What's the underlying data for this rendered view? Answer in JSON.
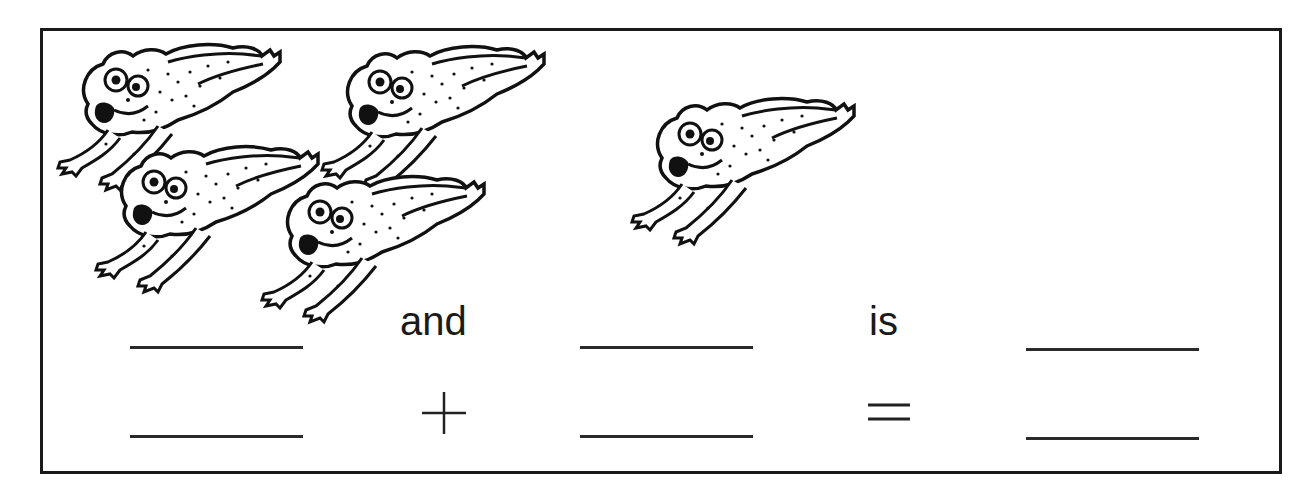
{
  "worksheet": {
    "title": "Frog addition worksheet",
    "group_a": {
      "count": 4,
      "icon": "frog-icon"
    },
    "group_b": {
      "count": 1,
      "icon": "frog-icon"
    },
    "sentence_row": {
      "word_1": "and",
      "word_2": "is",
      "blanks": [
        "",
        "",
        ""
      ]
    },
    "equation_row": {
      "plus": "+",
      "equals": "=",
      "blanks": [
        "",
        "",
        ""
      ]
    }
  }
}
